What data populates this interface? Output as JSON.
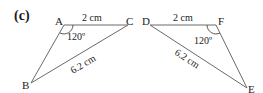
{
  "part_label": "(c)",
  "triangles": [
    {
      "name": "ABC",
      "vertices": {
        "A": "A",
        "B": "B",
        "C": "C"
      },
      "side_AC": "2 cm",
      "side_BC": "6.2 cm",
      "angle_A": "120º"
    },
    {
      "name": "DEF",
      "vertices": {
        "D": "D",
        "E": "E",
        "F": "F"
      },
      "side_DF": "2 cm",
      "side_DE": "6.2 cm",
      "angle_F": "120º"
    }
  ]
}
